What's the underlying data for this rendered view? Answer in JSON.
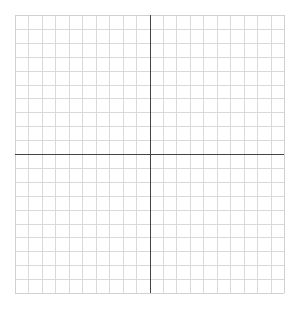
{
  "diagram": {
    "type": "coordinate-grid",
    "grid": {
      "columns": 20,
      "rows": 20,
      "left": 15,
      "top": 15,
      "right": 284,
      "bottom": 293,
      "grid_color": "#d9d9d9",
      "axis_color": "#444444",
      "border_color": "#d0d0d0"
    },
    "axes": {
      "x_axis_row_index": 10,
      "y_axis_col_index": 10,
      "x_axis_label": "",
      "y_axis_label": ""
    }
  }
}
